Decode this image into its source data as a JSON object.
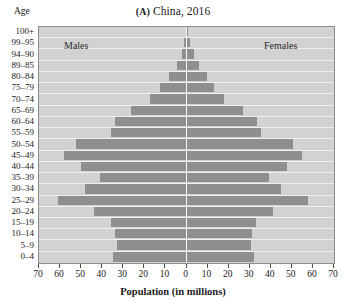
{
  "chart_data": {
    "type": "bar",
    "subtype": "population-pyramid",
    "title": "(A) China, 2016",
    "panel_mark": "(A)",
    "title_rest": " China, 2016",
    "xlabel": "Population (in millions)",
    "ylabel": "Age",
    "xlim": [
      -70,
      70
    ],
    "xticks": [
      70,
      60,
      50,
      40,
      30,
      20,
      10,
      0,
      10,
      20,
      30,
      40,
      50,
      60,
      70
    ],
    "grid": true,
    "legend_position": "inside-top",
    "series": [
      {
        "name": "Males",
        "side": "left"
      },
      {
        "name": "Females",
        "side": "right"
      }
    ],
    "categories": [
      "100+",
      "99–95",
      "94–90",
      "89–85",
      "80–84",
      "75–79",
      "70–74",
      "65–69",
      "60–64",
      "55–59",
      "50–54",
      "45–49",
      "40–44",
      "35–39",
      "30–34",
      "25–29",
      "20–24",
      "15–19",
      "10–14",
      "5–9",
      "0–4"
    ],
    "males": [
      0.4,
      1.0,
      2.2,
      4.5,
      8.5,
      12.5,
      17.5,
      26.5,
      34.0,
      36.0,
      52.5,
      58.0,
      50.0,
      41.0,
      48.0,
      61.0,
      44.0,
      36.0,
      34.0,
      33.0,
      35.0
    ],
    "females": [
      0.7,
      1.6,
      3.4,
      6.0,
      9.5,
      13.0,
      18.0,
      27.0,
      33.5,
      35.5,
      50.5,
      55.0,
      47.5,
      39.0,
      45.0,
      57.5,
      41.0,
      33.0,
      31.0,
      30.5,
      32.0
    ],
    "colors": {
      "bar": "#8f8f8f",
      "plot_background": "#d2d2d2",
      "gridline": "#efefef",
      "midline": "#fafafa",
      "frame": "#8d8d8d",
      "text": "#1a1a1a"
    }
  }
}
